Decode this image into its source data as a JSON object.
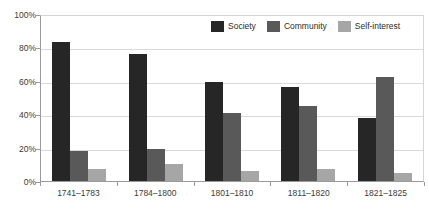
{
  "chart_data": {
    "type": "bar",
    "title": "",
    "subtitle": "",
    "xlabel": "",
    "ylabel": "",
    "ylim": [
      0,
      100
    ],
    "y_ticks": [
      "0%",
      "20%",
      "40%",
      "60%",
      "80%",
      "100%"
    ],
    "y_tick_values": [
      0,
      20,
      40,
      60,
      80,
      100
    ],
    "grid": true,
    "legend_position": "top-right",
    "categories": [
      "1741–1783",
      "1784–1800",
      "1801–1810",
      "1811–1820",
      "1821–1825"
    ],
    "series": [
      {
        "name": "Society",
        "color": "#262626",
        "values": [
          83,
          76,
          59,
          56,
          38
        ]
      },
      {
        "name": "Community",
        "color": "#595959",
        "values": [
          18,
          19,
          41,
          45,
          62
        ]
      },
      {
        "name": "Self-interest",
        "color": "#a6a6a6",
        "values": [
          7,
          10,
          6,
          7,
          5
        ]
      }
    ]
  },
  "legend": {
    "items": [
      {
        "label": "Society"
      },
      {
        "label": "Community"
      },
      {
        "label": "Self-interest"
      }
    ]
  },
  "colors": {
    "society": "#262626",
    "community": "#595959",
    "self_interest": "#a6a6a6",
    "gridline": "#d9d9d9",
    "axis": "#9a9a9a",
    "text": "#3a3a3a",
    "background": "#ffffff"
  }
}
